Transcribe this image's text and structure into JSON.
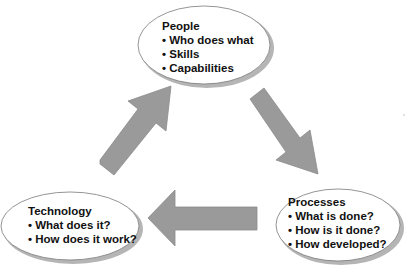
{
  "diagram": {
    "type": "cycle",
    "colors": {
      "arrow_fill": "#9a9a9a",
      "arrow_stroke": "#8a8a8a",
      "ellipse_fill": "#ffffff",
      "ellipse_stroke": "#7a7a7a",
      "shadow": "#b0b0b0",
      "text": "#111111"
    },
    "nodes": [
      {
        "id": "people",
        "title": "People",
        "bullets": [
          "Who does what",
          "Skills",
          "Capabilities"
        ]
      },
      {
        "id": "processes",
        "title": "Processes",
        "bullets": [
          "What is done?",
          "How is it done?",
          "How developed?"
        ]
      },
      {
        "id": "technology",
        "title": "Technology",
        "bullets": [
          "What does it?",
          "How does it work?"
        ]
      }
    ],
    "edges": [
      {
        "from": "people",
        "to": "processes",
        "direction": "down-right"
      },
      {
        "from": "processes",
        "to": "technology",
        "direction": "left"
      },
      {
        "from": "technology",
        "to": "people",
        "direction": "up-right"
      }
    ]
  }
}
